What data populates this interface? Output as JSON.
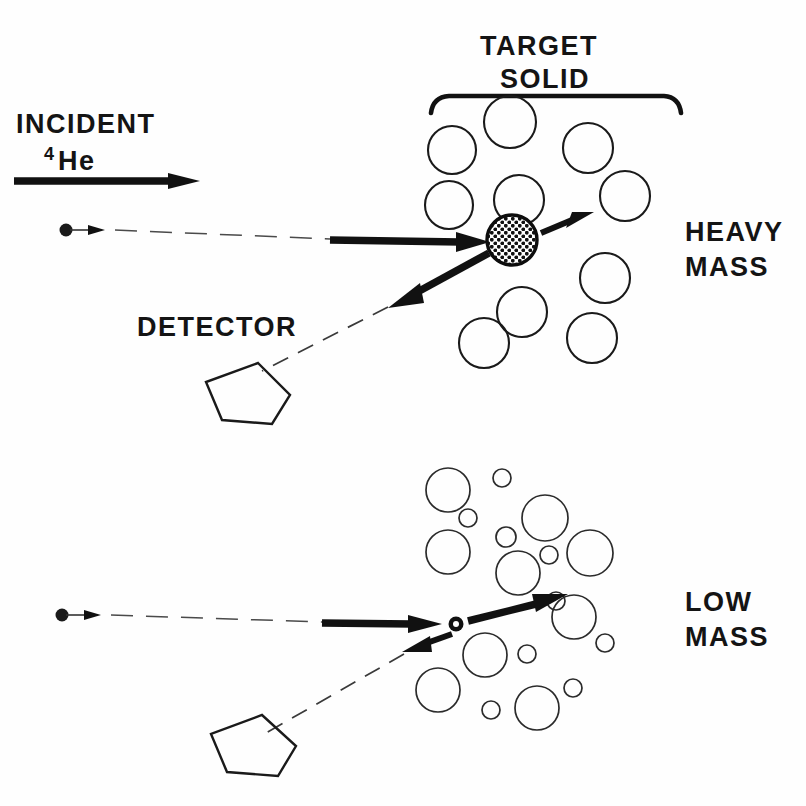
{
  "figure": {
    "title_visible": false,
    "background_color": "#fefefe",
    "ink_color": "#141414",
    "width": 806,
    "height": 806
  },
  "labels": {
    "target_line1": "TARGET",
    "target_line2": "SOLID",
    "incident": "INCIDENT",
    "incident_isotope_superscript": "4",
    "incident_isotope_element": "He",
    "detector": "DETECTOR",
    "heavy_line1": "HEAVY",
    "heavy_line2": "MASS",
    "low_line1": "LOW",
    "low_line2": "MASS"
  },
  "panels": {
    "top": {
      "name": "heavy-mass-panel",
      "target_atoms": [
        {
          "cx": 510,
          "cy": 122,
          "r": 26
        },
        {
          "cx": 452,
          "cy": 150,
          "r": 24
        },
        {
          "cx": 588,
          "cy": 148,
          "r": 25
        },
        {
          "cx": 519,
          "cy": 200,
          "r": 25
        },
        {
          "cx": 449,
          "cy": 205,
          "r": 24
        },
        {
          "cx": 625,
          "cy": 196,
          "r": 25
        },
        {
          "cx": 484,
          "cy": 310,
          "r": 25
        },
        {
          "cx": 605,
          "cy": 278,
          "r": 25
        },
        {
          "cx": 484,
          "cy": 325,
          "r": 0
        },
        {
          "cx": 578,
          "cy": 335,
          "r": 25
        }
      ],
      "struck_nucleus": {
        "cx": 512,
        "cy": 240,
        "r": 26,
        "pattern": "cross-hatch-dots"
      },
      "bracket": {
        "x1": 430,
        "x2": 681,
        "y": 95
      }
    },
    "bottom": {
      "name": "low-mass-panel",
      "target_atoms": [
        {
          "cx": 448,
          "cy": 490,
          "r": 22
        },
        {
          "cx": 502,
          "cy": 478,
          "r": 9
        },
        {
          "cx": 545,
          "cy": 518,
          "r": 23
        },
        {
          "cx": 468,
          "cy": 518,
          "r": 9
        },
        {
          "cx": 506,
          "cy": 537,
          "r": 10
        },
        {
          "cx": 448,
          "cy": 552,
          "r": 22
        },
        {
          "cx": 590,
          "cy": 553,
          "r": 23
        },
        {
          "cx": 549,
          "cy": 555,
          "r": 9
        },
        {
          "cx": 518,
          "cy": 573,
          "r": 22
        },
        {
          "cx": 556,
          "cy": 601,
          "r": 9
        },
        {
          "cx": 574,
          "cy": 617,
          "r": 22
        },
        {
          "cx": 485,
          "cy": 655,
          "r": 22
        },
        {
          "cx": 527,
          "cy": 654,
          "r": 9
        },
        {
          "cx": 573,
          "cy": 688,
          "r": 9
        },
        {
          "cx": 438,
          "cy": 690,
          "r": 22
        },
        {
          "cx": 491,
          "cy": 710,
          "r": 9
        },
        {
          "cx": 537,
          "cy": 708,
          "r": 22
        },
        {
          "cx": 605,
          "cy": 643,
          "r": 9
        }
      ],
      "struck_nucleus": {
        "cx": 456,
        "cy": 624,
        "r": 7,
        "pattern": "tiny-ring"
      }
    }
  },
  "beams": {
    "incident_beam_arrow": {
      "x1": 14,
      "y1": 181,
      "x2": 198,
      "y2": 181
    },
    "top_particle_dot": {
      "cx": 66,
      "cy": 230,
      "r": 6
    },
    "top_dashed_path": {
      "x1": 100,
      "y1": 230,
      "x2": 330,
      "y2": 240
    },
    "top_incident_arrow": {
      "x1": 330,
      "y1": 240,
      "x2": 488,
      "y2": 242
    },
    "top_recoil_arrow": {
      "x1": 540,
      "y1": 233,
      "x2": 590,
      "y2": 216
    },
    "top_backscatter_arrow": {
      "x1": 487,
      "y1": 254,
      "x2": 392,
      "y2": 305
    },
    "top_detector_dashed": {
      "x1": 392,
      "y1": 305,
      "x2": 258,
      "y2": 372
    },
    "bottom_particle_dot": {
      "cx": 62,
      "cy": 615,
      "r": 6
    },
    "bottom_dashed_path": {
      "x1": 96,
      "y1": 615,
      "x2": 322,
      "y2": 623
    },
    "bottom_incident_arrow": {
      "x1": 322,
      "y1": 623,
      "x2": 440,
      "y2": 625
    },
    "bottom_forward_arrow": {
      "x1": 466,
      "y1": 621,
      "x2": 562,
      "y2": 597
    },
    "bottom_backscatter_arrow": {
      "x1": 452,
      "y1": 634,
      "x2": 408,
      "y2": 651
    },
    "bottom_detector_dashed": {
      "x1": 404,
      "y1": 653,
      "x2": 260,
      "y2": 735
    }
  },
  "detectors": {
    "top": {
      "label_x": 140,
      "label_y": 330,
      "shape": "pentagon",
      "cx": 240,
      "cy": 390
    },
    "bottom": {
      "shape": "pentagon",
      "cx": 245,
      "cy": 740
    }
  }
}
